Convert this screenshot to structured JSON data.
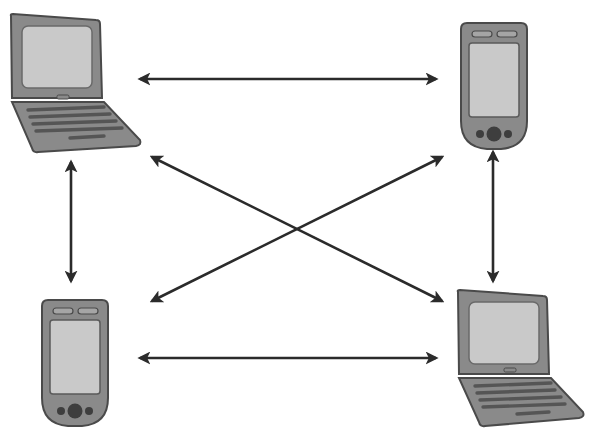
{
  "diagram": {
    "type": "peer-to-peer-network",
    "nodes": [
      {
        "id": "laptop-top-left",
        "kind": "laptop",
        "position": "top-left"
      },
      {
        "id": "pda-top-right",
        "kind": "pda",
        "position": "top-right"
      },
      {
        "id": "pda-bottom-left",
        "kind": "pda",
        "position": "bottom-left"
      },
      {
        "id": "laptop-bottom-right",
        "kind": "laptop",
        "position": "bottom-right"
      }
    ],
    "edges": [
      {
        "from": "laptop-top-left",
        "to": "pda-top-right",
        "direction": "bidirectional"
      },
      {
        "from": "laptop-top-left",
        "to": "pda-bottom-left",
        "direction": "bidirectional"
      },
      {
        "from": "laptop-top-left",
        "to": "laptop-bottom-right",
        "direction": "bidirectional"
      },
      {
        "from": "pda-top-right",
        "to": "pda-bottom-left",
        "direction": "bidirectional"
      },
      {
        "from": "pda-top-right",
        "to": "laptop-bottom-right",
        "direction": "bidirectional"
      },
      {
        "from": "pda-bottom-left",
        "to": "laptop-bottom-right",
        "direction": "bidirectional"
      }
    ],
    "colors": {
      "device_body": "#8a8a8a",
      "device_outline": "#4a4a4a",
      "screen": "#c9c9c9",
      "keys": "#555555",
      "arrow": "#2b2b2b",
      "background": "#ffffff"
    }
  }
}
